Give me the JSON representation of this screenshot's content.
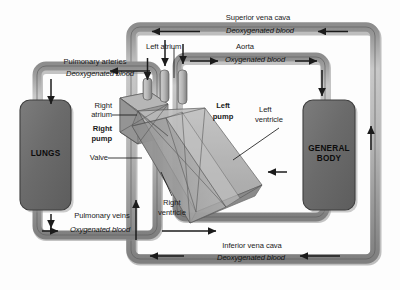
{
  "figure": {
    "kind": "biology-diagram",
    "background_color": "#fdfdfd",
    "palette": {
      "pipe_fill": "#b9b9b9",
      "pipe_edge": "#6e6e6e",
      "pipe_shadow": "#8f8f8f",
      "pipe_lumen": "#dcdcdc",
      "organ_fill": "#6f6f6f",
      "organ_edge": "#3a3a3a",
      "heart_fill": "#9a9a9a",
      "heart_light": "#c4c4c4",
      "heart_dark": "#7a7a7a",
      "arrow_color": "#1b1b1b",
      "text_color": "#1a1a1a",
      "leader_color": "#1b1b1b"
    }
  },
  "organs": [
    {
      "name": "lungs",
      "label": "LUNGS"
    },
    {
      "name": "general-body",
      "label": "GENERAL\nBODY"
    }
  ],
  "vessels": [
    {
      "name": "pulmonary-arteries",
      "title": "Pulmonary arteries",
      "blood": "Deoxygenated blood",
      "flow": "heart-to-lungs"
    },
    {
      "name": "pulmonary-veins",
      "title": "Pulmonary veins",
      "blood": "Oxygenated blood",
      "flow": "lungs-to-heart"
    },
    {
      "name": "aorta",
      "title": "Aorta",
      "blood": "Oxygenated blood",
      "flow": "heart-to-body"
    },
    {
      "name": "superior-vena-cava",
      "title": "Superior vena cava",
      "blood": "Deoxygenated blood",
      "flow": "body-to-heart"
    },
    {
      "name": "inferior-vena-cava",
      "title": "Inferior vena cava",
      "blood": "Deoxygenated blood",
      "flow": "body-to-heart"
    }
  ],
  "heart_parts": [
    {
      "name": "right-atrium",
      "label": "Right\natrium",
      "emphasis": "normal"
    },
    {
      "name": "right-pump",
      "label": "Right\npump",
      "emphasis": "bold"
    },
    {
      "name": "valve",
      "label": "Valve",
      "emphasis": "normal"
    },
    {
      "name": "left-atrium",
      "label": "Left atrium",
      "emphasis": "normal"
    },
    {
      "name": "left-pump",
      "label": "Left\npump",
      "emphasis": "bold"
    },
    {
      "name": "left-ventricle",
      "label": "Left\nventricle",
      "emphasis": "normal"
    },
    {
      "name": "right-ventricle",
      "label": "Right\nventricle",
      "emphasis": "normal"
    }
  ],
  "labels": {
    "superior_vena_cava": "Superior vena cava",
    "superior_vena_cava_blood": "Deoxygenated blood",
    "aorta": "Aorta",
    "aorta_blood": "Oxygenated blood",
    "pulmonary_arteries": "Pulmonary arteries",
    "pulmonary_arteries_blood": "Deoxygenated blood",
    "pulmonary_veins": "Pulmonary veins",
    "pulmonary_veins_blood": "Oxygenated blood",
    "inferior_vena_cava": "Inferior vena cava",
    "inferior_vena_cava_blood": "Deoxygenated blood",
    "left_atrium": "Left atrium",
    "right_atrium_l1": "Right",
    "right_atrium_l2": "atrium",
    "right_pump_l1": "Right",
    "right_pump_l2": "pump",
    "valve": "Valve",
    "left_pump_l1": "Left",
    "left_pump_l2": "pump",
    "left_ventricle_l1": "Left",
    "left_ventricle_l2": "ventricle",
    "right_ventricle_l1": "Right",
    "right_ventricle_l2": "ventricle",
    "lungs": "LUNGS",
    "general_body": "GENERAL\nBODY"
  }
}
